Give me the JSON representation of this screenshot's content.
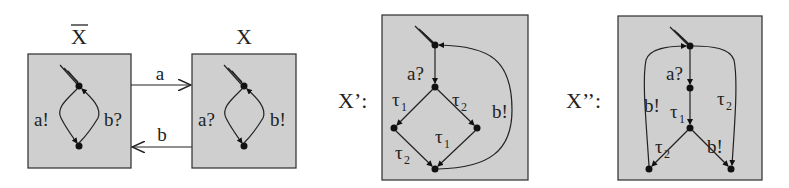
{
  "diagram": {
    "automata": [
      {
        "id": "xbar",
        "title": "X",
        "title_overline": true,
        "edges": [
          {
            "label": "a!",
            "side": "left"
          },
          {
            "label": "b?",
            "side": "right"
          }
        ]
      },
      {
        "id": "x",
        "title": "X",
        "edges": [
          {
            "label": "a?",
            "side": "left"
          },
          {
            "label": "b!",
            "side": "right"
          }
        ]
      },
      {
        "id": "x-prime",
        "title": "X’:",
        "edges": [
          {
            "label": "a?"
          },
          {
            "label": "τ",
            "sub": "1",
            "pos": "upper-left"
          },
          {
            "label": "τ",
            "sub": "2",
            "pos": "upper-right"
          },
          {
            "label": "τ",
            "sub": "1",
            "pos": "lower-right"
          },
          {
            "label": "τ",
            "sub": "2",
            "pos": "lower-left"
          },
          {
            "label": "b!",
            "pos": "loop-back"
          }
        ]
      },
      {
        "id": "x-double-prime",
        "title": "X’’:",
        "edges": [
          {
            "label": "a?"
          },
          {
            "label": "τ",
            "sub": "1"
          },
          {
            "label": "b!",
            "pos": "left-outer"
          },
          {
            "label": "τ",
            "sub": "2",
            "pos": "right-outer"
          },
          {
            "label": "τ",
            "sub": "2",
            "pos": "lower-left"
          },
          {
            "label": "b!",
            "pos": "lower-right"
          }
        ]
      }
    ],
    "channels": [
      {
        "label": "a",
        "from": "xbar",
        "to": "x"
      },
      {
        "label": "b",
        "from": "x",
        "to": "xbar"
      }
    ]
  }
}
